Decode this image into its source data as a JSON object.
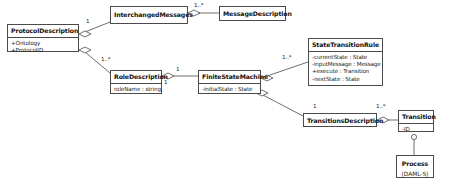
{
  "diagram": {
    "type": "uml-class-diagram",
    "background_color": "#ffffff",
    "line_color": "#4a4a4a",
    "text_color": "#111111"
  },
  "classes": [
    {
      "id": "protocol-description",
      "name": "ProtocolDescription",
      "attributes": [
        "+Ontology",
        "+ProtocolID"
      ],
      "x": 7,
      "y": 24,
      "w": 72,
      "h": 28
    },
    {
      "id": "interchanged-messages",
      "name": "InterchangedMessages",
      "attributes": [],
      "x": 110,
      "y": 6,
      "w": 78,
      "h": 18
    },
    {
      "id": "message-description",
      "name": "MessageDescription",
      "attributes": [],
      "x": 219,
      "y": 6,
      "w": 67,
      "h": 15
    },
    {
      "id": "role-description",
      "name": "RoleDescription",
      "attributes": [
        "roleName : string"
      ],
      "x": 110,
      "y": 70,
      "w": 52,
      "h": 24
    },
    {
      "id": "finite-state-machine",
      "name": "FiniteStateMachine",
      "attributes": [
        "-initialState : State"
      ],
      "x": 198,
      "y": 70,
      "w": 63,
      "h": 24
    },
    {
      "id": "state-transition-rule",
      "name": "StateTransitionRule",
      "attributes": [
        "-currentState : State",
        "-inputMessage : Message",
        "+execute : Transition",
        "-nextState : State"
      ],
      "x": 308,
      "y": 38,
      "w": 75,
      "h": 48
    },
    {
      "id": "transitions-description",
      "name": "TransitionsDescription",
      "attributes": [],
      "x": 303,
      "y": 113,
      "w": 74,
      "h": 14
    },
    {
      "id": "transition",
      "name": "Transition",
      "attributes": [
        "-ID"
      ],
      "x": 398,
      "y": 110,
      "w": 36,
      "h": 22
    },
    {
      "id": "process",
      "name": "Process",
      "subtitle": "(DAML-S)",
      "attributes": [],
      "x": 396,
      "y": 155,
      "w": 38,
      "h": 23
    }
  ],
  "multiplicities": [
    {
      "id": "m-protocol-interchanged",
      "label": "1",
      "x": 86,
      "y": 18
    },
    {
      "id": "m-interchanged-message",
      "label": "1..*",
      "x": 194,
      "y": 3
    },
    {
      "id": "m-protocol-role",
      "label": "1..*",
      "x": 101,
      "y": 56
    },
    {
      "id": "m-role-fsm-right",
      "label": "1",
      "x": 175,
      "y": 67
    },
    {
      "id": "m-role-fsm-bottom",
      "label": "1",
      "x": 164,
      "y": 80
    },
    {
      "id": "m-fsm-rule",
      "label": "1..*",
      "x": 280,
      "y": 55
    },
    {
      "id": "m-fsm-transitions",
      "label": "1",
      "x": 312,
      "y": 104
    },
    {
      "id": "m-transitions-transition",
      "label": "1..*",
      "x": 377,
      "y": 104
    }
  ],
  "relationships": [
    {
      "id": "rel-protocol-interchanged",
      "from": "protocol-description",
      "to": "interchanged-messages",
      "kind": "aggregation"
    },
    {
      "id": "rel-interchanged-message",
      "from": "interchanged-messages",
      "to": "message-description",
      "kind": "aggregation"
    },
    {
      "id": "rel-protocol-role",
      "from": "protocol-description",
      "to": "role-description",
      "kind": "aggregation"
    },
    {
      "id": "rel-role-fsm",
      "from": "role-description",
      "to": "finite-state-machine",
      "kind": "aggregation"
    },
    {
      "id": "rel-fsm-rule",
      "from": "finite-state-machine",
      "to": "state-transition-rule",
      "kind": "aggregation"
    },
    {
      "id": "rel-fsm-transitions",
      "from": "finite-state-machine",
      "to": "transitions-description",
      "kind": "aggregation"
    },
    {
      "id": "rel-transitions-transition",
      "from": "transitions-description",
      "to": "transition",
      "kind": "aggregation"
    },
    {
      "id": "rel-transition-process",
      "from": "transition",
      "to": "process",
      "kind": "realization"
    }
  ]
}
